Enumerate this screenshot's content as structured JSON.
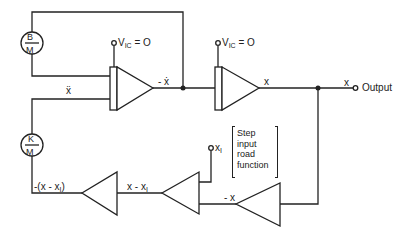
{
  "diagram": {
    "type": "analog computer block diagram",
    "coefficients": {
      "top": {
        "num": "B",
        "den": "M"
      },
      "bottom": {
        "num": "K",
        "den": "M"
      }
    },
    "integrators": [
      {
        "ic_label": "V",
        "ic_sub": "IC",
        "ic_value": "= O",
        "output_label": "- ẋ"
      },
      {
        "ic_label": "V",
        "ic_sub": "IC",
        "ic_value": "= O",
        "output_label": "x"
      }
    ],
    "signals": {
      "xddot": "ẍ",
      "output_x": "x",
      "output": "Output",
      "neg_x": "- x",
      "x_minus_x1": "x - x",
      "x_minus_x1_sub": "I",
      "neg_x_minus_x1": "-(x - x",
      "neg_x_minus_x1_sub": "I",
      "neg_x_minus_x1_close": ")",
      "x1": "x",
      "x1_sub": "I"
    },
    "note_lines": [
      "Step",
      "input",
      "road",
      "function"
    ]
  }
}
